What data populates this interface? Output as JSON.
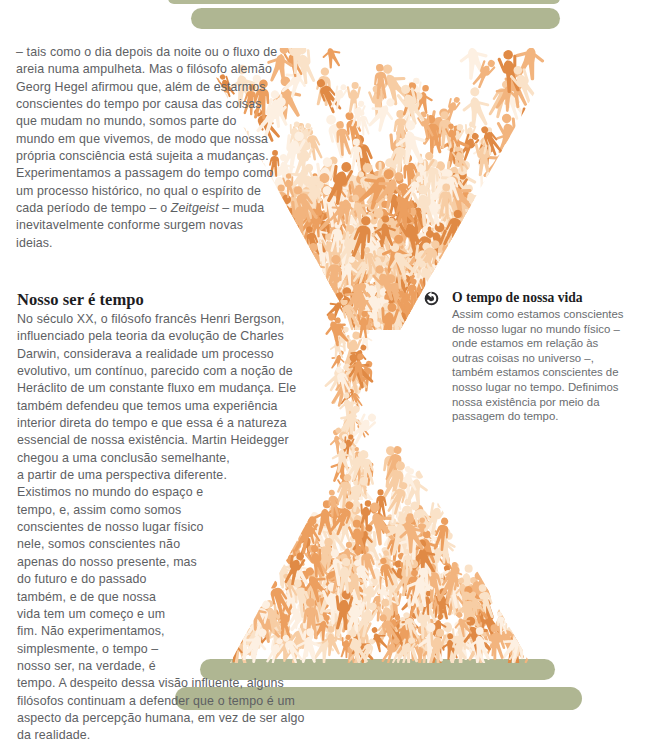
{
  "page": {
    "width": 655,
    "height": 715,
    "background": "#ffffff",
    "body_text_color": "#5d6063",
    "heading_color": "#1d1d1f",
    "accent_green": "#a8b089",
    "accent_orange": "#e8954e",
    "accent_orange_light": "#f6d3ad",
    "accent_orange_pale": "#fbe9d6"
  },
  "article": {
    "intro_paragraph": "– tais como o dia depois da noite ou o fluxo de areia numa ampulheta. Mas o filósofo alemão Georg Hegel afirmou que, além de estarmos conscientes do tempo por causa das coisas que mudam no mundo, somos parte do mundo em que vivemos, de modo que nossa própria consciência está sujeita a mudanças. Experimentamos a passagem do tempo como um processo histórico, no qual o espírito de cada período de tempo – o ",
    "intro_italic_term": "Zeitgeist",
    "intro_paragraph_tail": " – muda inevitavelmente conforme surgem novas ideias.",
    "section_heading": "Nosso ser é tempo",
    "section_paragraph": "No século XX, o filósofo francês Henri Bergson, influenciado pela teoria da evolução de Charles Darwin, considerava a realidade um processo evolutivo, um contínuo, parecido com a noção de Heráclito de um constante fluxo em mudança. Ele também defendeu que temos uma experiência interior direta do tempo e que essa é a natureza essencial de nossa existência. Martin Heidegger chegou a uma conclusão semelhante, a partir de uma perspectiva diferente. Existimos no mundo do espaço e tempo, e, assim como somos conscientes de nosso lugar físico nele, somos conscientes não apenas do nosso presente, mas do futuro e do passado também, e de que nossa vida tem um começo e um fim. Não experimentamos, simplesmente, o tempo – nosso ser, na verdade, é tempo. A despeito dessa visão influente, alguns filósofos continuam a defender que o tempo é um aspecto da percepção humana, em vez de ser algo da realidade."
  },
  "sidebar": {
    "icon": "rotate-left-circle-icon",
    "heading": "O tempo de nossa vida",
    "paragraph": "Assim como estamos conscientes de nosso lugar no mundo físico – onde estamos em relação às outras coisas no universo –, também estamos conscientes de nosso lugar no tempo. Definimos nossa existência por meio da passagem do tempo."
  },
  "illustration": {
    "name": "hourglass-of-people",
    "description": "An hourglass formed by a crowd of stylized human figures in orange tones, flowing from an upper bulb through a narrow neck into a lower bulb, framed by green capsule bars at the top and bottom.",
    "green_bars": [
      {
        "name": "top-bar-cut",
        "x": 168,
        "y": -8,
        "w": 392,
        "h": 12
      },
      {
        "name": "top-bar-main",
        "x": 191,
        "y": 8,
        "w": 369,
        "h": 21
      },
      {
        "name": "bottom-bar-upper",
        "x": 200,
        "y": 659,
        "w": 355,
        "h": 21
      },
      {
        "name": "bottom-bar-lower",
        "x": 175,
        "y": 687,
        "w": 407,
        "h": 23
      }
    ],
    "figure_tones": [
      "#e08a45",
      "#ec9f5f",
      "#f2b47e",
      "#f7cda4",
      "#fae2c8",
      "#fdf0e2"
    ]
  }
}
